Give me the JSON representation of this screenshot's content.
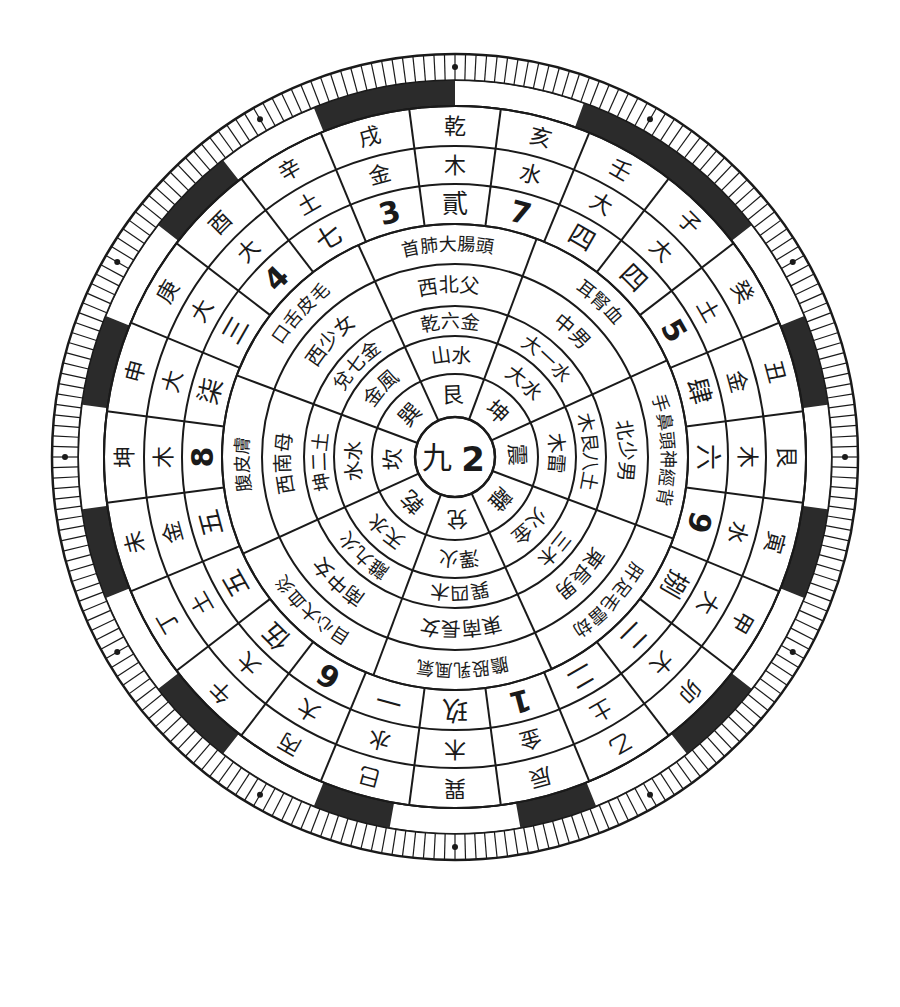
{
  "diagram": {
    "title": "",
    "center": {
      "cx": 455,
      "cy": 457
    },
    "colors": {
      "ink": "#1a1a1a",
      "paper": "#ffffff",
      "band": "#2b2b2b"
    },
    "center_label": {
      "left": "九",
      "right": "2"
    },
    "inner_rings": {
      "sector_count": 8,
      "center_angle_offset_deg": -92,
      "radii": [
        40,
        83,
        121,
        151,
        193,
        233
      ],
      "rings": [
        {
          "name": "trigram-ring",
          "cells": [
            "艮",
            "坤",
            "震",
            "離",
            "兌",
            "乾",
            "坎",
            "巽"
          ]
        },
        {
          "name": "number-element-ring",
          "cells": [
            "土八",
            "土八",
            "木三",
            "火九",
            "金七",
            "金六",
            "水一",
            "木四"
          ],
          "cells_display": [
            "山土",
            "地土",
            "雷木",
            "火金",
            "澤火",
            "天水",
            "金風",
            "水水"
          ]
        },
        {
          "name": "element-number-ring",
          "cells": [
            "乾六金",
            "坤二土",
            "震三木",
            "離九火",
            "兌七金",
            "乾六金",
            "坎一水",
            "巽四木"
          ]
        },
        {
          "name": "direction-ring",
          "cells": [
            "西北父",
            "西南母",
            "東長男",
            "南中女",
            "巽四木",
            "西少女",
            "北中男",
            "東北少男"
          ]
        },
        {
          "name": "body-ring",
          "cells": [
            "首肺大腸頭骨",
            "腹皮膚",
            "足肝毛髮",
            "目心血",
            "股乳風氣膽",
            "口舌皮毛",
            "耳腎血",
            "手鼻頭神經背"
          ]
        }
      ]
    },
    "inner_text": {
      "ring1": [
        "艮",
        "坤",
        "震",
        "離",
        "兌",
        "乾",
        "坎",
        "巽"
      ],
      "ring2": [
        "山 水",
        "大 水",
        "木 雷",
        "火 金",
        "澤 火",
        "天 水",
        "水 水",
        "金 風"
      ],
      "ring3": [
        "乾 六 金",
        "大 一 水",
        "木 艮 八 土",
        "三 木",
        "巽 四 木",
        "離 九 火",
        "坤 二 土",
        "兌 七 金"
      ],
      "ring4": [
        "西 北 父",
        "中 男",
        "北 少 男",
        "東 長 男",
        "東 南 長 女",
        "南 中 女",
        "西 南 母",
        "西 少 女"
      ],
      "ring5": [
        "首 肺 大 腸 頭",
        "耳 腎 血",
        "手 鼻 頭 神 經 背",
        "肝 足 毛 雷 劫",
        "膽 股 乳 風 氣",
        "目 心 大 血 炎",
        "腹 皮 膚",
        "口 舌 皮 毛"
      ]
    },
    "outer_rings": {
      "sector_count": 24,
      "center_angle_offset_deg": -90,
      "radii": [
        233,
        273,
        311,
        351
      ],
      "ring6_numbers": [
        "貳",
        "7",
        "四",
        "四",
        "5",
        "肆",
        "六",
        "9",
        "捌",
        "二",
        "二",
        "1",
        "玖",
        "一",
        "6",
        "伍",
        "五",
        "五",
        "8",
        "柒",
        "三",
        "4",
        "七",
        "3"
      ],
      "ring7_elements": [
        "木",
        "水",
        "大",
        "大",
        "土",
        "金",
        "木",
        "水",
        "大",
        "大",
        "土",
        "金",
        "木",
        "水",
        "大",
        "大",
        "土",
        "金",
        "木",
        "大",
        "大",
        "大",
        "土",
        "金"
      ],
      "ring8_mountains": [
        "乾",
        "亥",
        "壬",
        "子",
        "癸",
        "丑",
        "艮",
        "寅",
        "甲",
        "卯",
        "乙",
        "辰",
        "巽",
        "巳",
        "丙",
        "午",
        "丁",
        "未",
        "坤",
        "申",
        "庚",
        "酉",
        "辛",
        "戌"
      ]
    },
    "band": {
      "inner_radius": 351,
      "outer_radius": 377,
      "white_segments_deg": [
        [
          -90,
          -70
        ],
        [
          -38,
          -22
        ],
        [
          -8,
          8
        ],
        [
          22,
          38
        ],
        [
          52,
          68
        ],
        [
          80,
          100
        ],
        [
          112,
          128
        ],
        [
          142,
          158
        ],
        [
          172,
          188
        ],
        [
          202,
          218
        ],
        [
          232,
          248
        ]
      ]
    },
    "tick_ring": {
      "inner_radius": 377,
      "outer_radius": 403,
      "tick_count": 240,
      "dot_positions_deg": [
        -90,
        -60,
        -30,
        0,
        30,
        60,
        90,
        120,
        150,
        180,
        210,
        240
      ]
    }
  }
}
